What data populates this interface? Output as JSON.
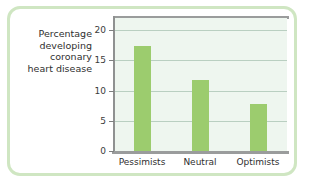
{
  "chart_data": {
    "type": "bar",
    "title": "",
    "subtitle": "",
    "xlabel": "",
    "ylabel": "Percentage developing coronary heart disease",
    "categories": [
      "Pessimists",
      "Neutral",
      "Optimists"
    ],
    "values": [
      17.3,
      11.8,
      7.8
    ],
    "series": [
      {
        "name": "Percentage developing coronary heart disease",
        "values": [
          17.3,
          11.8,
          7.8
        ]
      }
    ],
    "ylim": [
      0,
      22
    ],
    "yticks": [
      0,
      5,
      10,
      15,
      20
    ],
    "ytick_labels": [
      "0",
      "5",
      "10",
      "15",
      "20"
    ],
    "grid": true,
    "grid_axis": "y",
    "legend": false,
    "legend_position": "none",
    "bar_color": "#9ccc6e",
    "plot_background": "#eef6ef",
    "axis_color": "#9a9c9c",
    "gridline_color": "#b9cfc1",
    "frame_color": "#cfe6c2"
  },
  "axis_title": {
    "line1": "Percentage",
    "line2": "developing",
    "line3": "coronary",
    "line4": "heart disease"
  }
}
